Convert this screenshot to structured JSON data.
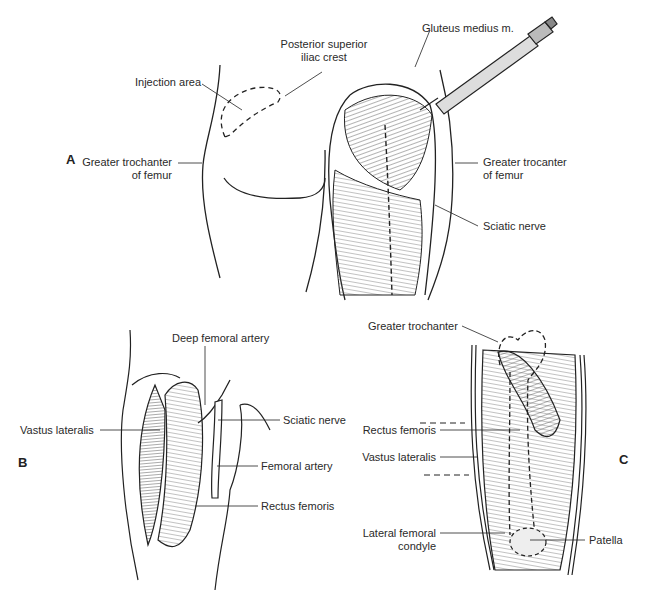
{
  "figure": {
    "panels": [
      {
        "id": "A",
        "letter": "A",
        "labels": {
          "injection_area": "Injection area",
          "posterior_superior_iliac_crest_1": "Posterior superior",
          "posterior_superior_iliac_crest_2": "iliac crest",
          "gluteus_medius": "Gluteus medius m.",
          "greater_trochanter_left_1": "Greater trochanter",
          "greater_trochanter_left_2": "of femur",
          "greater_trochanter_right_1": "Greater trocanter",
          "greater_trochanter_right_2": "of femur",
          "sciatic_nerve": "Sciatic nerve"
        }
      },
      {
        "id": "B",
        "letter": "B",
        "labels": {
          "deep_femoral_artery": "Deep femoral artery",
          "vastus_lateralis": "Vastus lateralis",
          "sciatic_nerve": "Sciatic nerve",
          "femoral_artery": "Femoral artery",
          "rectus_femoris": "Rectus femoris"
        }
      },
      {
        "id": "C",
        "letter": "C",
        "labels": {
          "greater_trochanter": "Greater trochanter",
          "rectus_femoris": "Rectus femoris",
          "vastus_lateralis": "Vastus lateralis",
          "lateral_femoral_condyle_1": "Lateral femoral",
          "lateral_femoral_condyle_2": "condyle",
          "patella": "Patella"
        }
      }
    ]
  }
}
